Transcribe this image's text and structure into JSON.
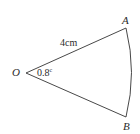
{
  "diagram": {
    "type": "sector",
    "vertices": {
      "O": {
        "label": "O",
        "x": 26,
        "y": 73
      },
      "A": {
        "label": "A",
        "x": 126,
        "y": 28
      },
      "B": {
        "label": "B",
        "x": 126,
        "y": 117
      }
    },
    "radius_label": "4cm",
    "angle_value": "0.8",
    "angle_unit": "c",
    "stroke_color": "#333333",
    "text_color": "#2b2b2b"
  }
}
